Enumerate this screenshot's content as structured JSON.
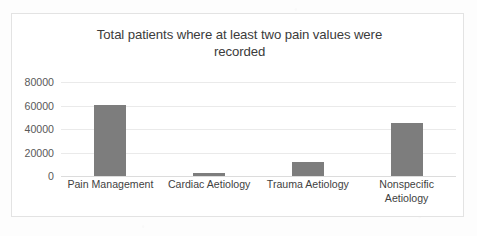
{
  "chart_data": {
    "type": "bar",
    "title": "Total patients where at least two pain values were recorded",
    "title_line1": "Total patients where at least two pain values were",
    "title_line2": "recorded",
    "categories": [
      "Pain Management",
      "Cardiac Aetiology",
      "Trauma Aetiology",
      "Nonspecific Aetiology"
    ],
    "category_labels_display": [
      "Pain Management",
      "Cardiac Aetiology",
      "Trauma Aetiology",
      "Nonspecific\nAetiology"
    ],
    "values": [
      60700,
      2500,
      11900,
      44700
    ],
    "xlabel": "",
    "ylabel": "",
    "ylim": [
      0,
      80000
    ],
    "ytick_labels": [
      "80000",
      "60000",
      "40000",
      "20000",
      "0"
    ],
    "ytick_values": [
      80000,
      60000,
      40000,
      20000,
      0
    ],
    "grid": true,
    "legend": false,
    "series_color": "#7d7d7d",
    "gridline_color": "#eaeaea",
    "frame_border_color": "#e3e3e3",
    "background_color": "#ffffff"
  }
}
